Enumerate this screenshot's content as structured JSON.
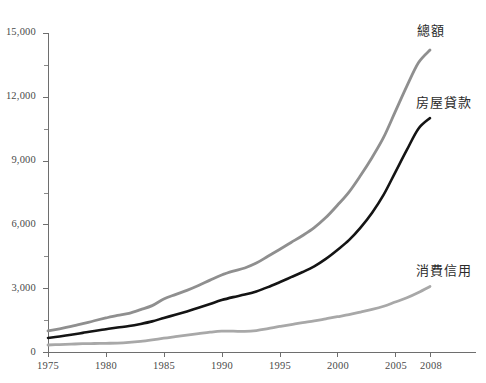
{
  "chart_data": {
    "type": "line",
    "title": "",
    "subtitle": "",
    "xlabel": "",
    "ylabel": "",
    "xlim": [
      1975,
      2008
    ],
    "ylim": [
      0,
      15000
    ],
    "grid": false,
    "legend_position": "inline-right-of-line-ends",
    "x_ticks": [
      "1975",
      "1980",
      "1985",
      "1990",
      "1995",
      "2000",
      "2005",
      "2008"
    ],
    "x_tick_values": [
      1975,
      1980,
      1985,
      1990,
      1995,
      2000,
      2005,
      2008
    ],
    "y_ticks": [
      "0",
      "3,000",
      "6,000",
      "9,000",
      "12,000",
      "15,000"
    ],
    "y_tick_values": [
      0,
      3000,
      6000,
      9000,
      12000,
      15000
    ],
    "y_minor_tick_values": [
      1500,
      4500,
      7500,
      10500,
      13500
    ],
    "x": [
      1975,
      1976,
      1977,
      1978,
      1979,
      1980,
      1981,
      1982,
      1983,
      1984,
      1985,
      1986,
      1987,
      1988,
      1989,
      1990,
      1991,
      1992,
      1993,
      1994,
      1995,
      1996,
      1997,
      1998,
      1999,
      2000,
      2001,
      2002,
      2003,
      2004,
      2005,
      2006,
      2007,
      2008
    ],
    "series": [
      {
        "name": "總額",
        "color": "#8f8f8f",
        "values": [
          990,
          1090,
          1200,
          1330,
          1470,
          1600,
          1720,
          1820,
          1990,
          2180,
          2490,
          2700,
          2900,
          3130,
          3380,
          3620,
          3800,
          3950,
          4180,
          4500,
          4820,
          5150,
          5480,
          5850,
          6320,
          6900,
          7520,
          8300,
          9150,
          10100,
          11300,
          12500,
          13600,
          14200
        ]
      },
      {
        "name": "房屋貸款",
        "color": "#141414",
        "values": [
          660,
          730,
          810,
          900,
          990,
          1070,
          1150,
          1220,
          1320,
          1440,
          1600,
          1750,
          1910,
          2080,
          2260,
          2440,
          2580,
          2700,
          2850,
          3050,
          3280,
          3520,
          3760,
          4030,
          4380,
          4800,
          5260,
          5850,
          6550,
          7400,
          8450,
          9500,
          10500,
          11000
        ]
      },
      {
        "name": "消費信用",
        "color": "#a8a8a8",
        "values": [
          330,
          350,
          370,
          390,
          400,
          410,
          420,
          450,
          500,
          570,
          650,
          720,
          790,
          860,
          930,
          980,
          980,
          970,
          1010,
          1100,
          1200,
          1290,
          1380,
          1460,
          1560,
          1660,
          1760,
          1880,
          2000,
          2150,
          2350,
          2550,
          2800,
          3080
        ]
      }
    ],
    "annotations": [
      {
        "text": "總額",
        "x": 2008,
        "y": 14900
      },
      {
        "text": "房屋貸款",
        "x": 2008,
        "y": 11500
      },
      {
        "text": "消費信用",
        "x": 2008,
        "y": 3700
      }
    ]
  },
  "axes": {
    "y_label_0": "0",
    "y_label_3000": "3,000",
    "y_label_6000": "6,000",
    "y_label_9000": "9,000",
    "y_label_12000": "12,000",
    "y_label_15000": "15,000",
    "x_label_1975": "1975",
    "x_label_1980": "1980",
    "x_label_1985": "1985",
    "x_label_1990": "1990",
    "x_label_1995": "1995",
    "x_label_2000": "2000",
    "x_label_2005": "2005",
    "x_label_2008": "2008"
  },
  "labels": {
    "total": "總額",
    "mortgage": "房屋貸款",
    "consumer_credit": "消費信用"
  },
  "colors": {
    "total_line": "#8f8f8f",
    "mortgage_line": "#141414",
    "consumer_line": "#a8a8a8",
    "axis": "#6e6e6e",
    "background": "#ffffff",
    "text": "#3a3a3a"
  }
}
